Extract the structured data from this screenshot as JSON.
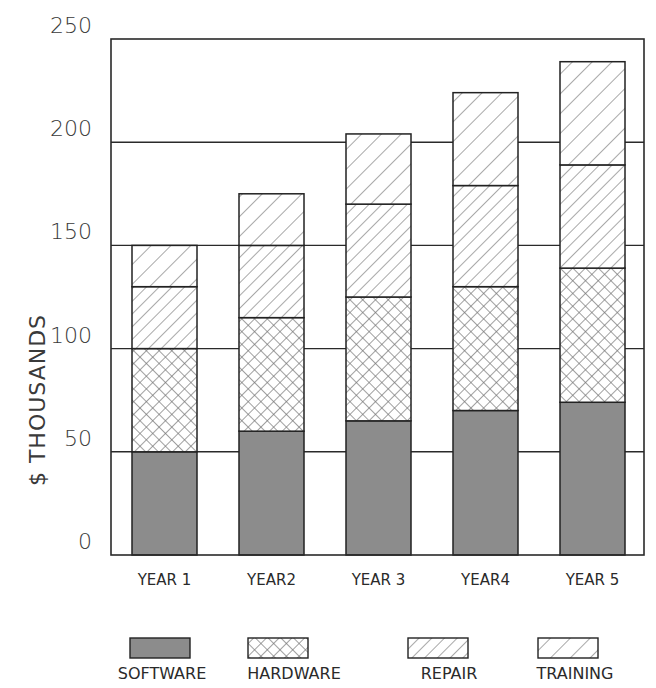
{
  "chart_data": {
    "type": "bar",
    "stacked": true,
    "title": "",
    "title_note": "title is cropped off at top edge; only bottoms of letters visible",
    "xlabel": "",
    "ylabel": "$ THOUSANDS",
    "ylim": [
      0,
      250
    ],
    "yticks": [
      0,
      50,
      100,
      150,
      200,
      250
    ],
    "grid": true,
    "legend_position": "bottom",
    "categories": [
      "YEAR 1",
      "YEAR2",
      "YEAR 3",
      "YEAR4",
      "YEAR 5"
    ],
    "series": [
      {
        "name": "SOFTWARE",
        "pattern": "solid",
        "color": "#808080",
        "values": [
          50,
          60,
          65,
          70,
          74
        ]
      },
      {
        "name": "HARDWARE",
        "pattern": "crosshatch",
        "color": "#9a9a9a",
        "values": [
          50,
          55,
          60,
          60,
          65
        ]
      },
      {
        "name": "REPAIR",
        "pattern": "diagonal-dense",
        "color": "#8a8a8a",
        "values": [
          30,
          35,
          45,
          49,
          50
        ]
      },
      {
        "name": "TRAINING",
        "pattern": "diagonal-sparse",
        "color": "#8a8a8a",
        "values": [
          20,
          25,
          34,
          45,
          50
        ]
      }
    ],
    "totals": [
      150,
      175,
      204,
      224,
      239
    ]
  },
  "axis": {
    "ylabel": "$ THOUSANDS",
    "yticks": [
      "0",
      "50",
      "100",
      "150",
      "200",
      "250"
    ]
  },
  "legend": {
    "items": [
      "SOFTWARE",
      "HARDWARE",
      "REPAIR",
      "TRAINING"
    ]
  }
}
